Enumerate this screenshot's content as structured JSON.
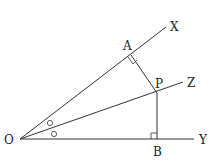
{
  "diagram": {
    "title": "",
    "points": {
      "O": {
        "label": "O",
        "x": 20,
        "y": 139
      },
      "A": {
        "label": "A",
        "x": 131,
        "y": 55
      },
      "P": {
        "label": "P",
        "x": 157,
        "y": 93
      },
      "B": {
        "label": "B",
        "x": 157,
        "y": 139
      }
    },
    "ray_labels": {
      "X": "X",
      "Z": "Z",
      "Y": "Y"
    },
    "angle_marks": [
      "○",
      "○"
    ],
    "right_angles": [
      "A",
      "B"
    ],
    "line_color": "#333333"
  }
}
